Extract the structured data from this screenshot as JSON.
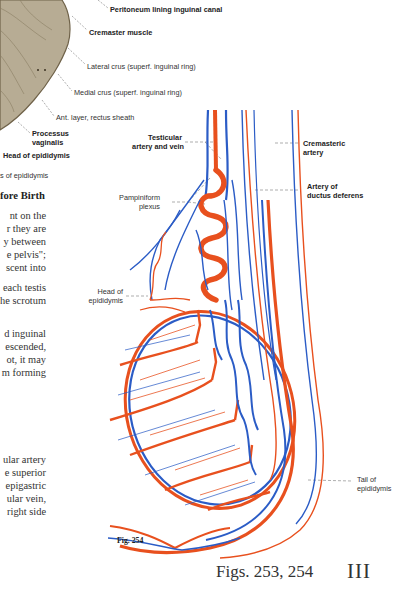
{
  "fig253_labels": {
    "peritoneum": "Peritoneum lining inguinal canal",
    "cremaster": "Cremaster muscle",
    "lateral_crus": "Lateral crus (superf. inguinal ring)",
    "medial_crus": "Medial crus (superf. inguinal ring)",
    "ant_layer": "Ant. layer, rectus sheath",
    "processus_1": "Processus",
    "processus_2": "vaginalis",
    "head_epididymis": "Head of epididymis",
    "body_epididymis": "s of epididymis"
  },
  "fig254_labels": {
    "testicular_1": "Testicular",
    "testicular_2": "artery and vein",
    "cremasteric_1": "Cremasteric",
    "cremasteric_2": "artery",
    "ductus_1": "Artery of",
    "ductus_2": "ductus deferens",
    "pampiniform_1": "Pampiniform",
    "pampiniform_2": "plexus",
    "head_1": "Head of",
    "head_2": "epididymis",
    "tail_1": "Tail of",
    "tail_2": "epididymis"
  },
  "text_block": {
    "heading": "fore Birth",
    "para1": [
      "nt on the",
      "r they are",
      "y between",
      "e pelvis\";",
      "scent into"
    ],
    "para2": [
      "each testis",
      "he scrotum"
    ],
    "para3": [
      "d inguinal",
      "escended,",
      "ot, it may",
      "m forming"
    ],
    "para4": [
      "ular artery",
      "e superior",
      "epigastric",
      "ular vein,",
      "right side"
    ]
  },
  "captions": {
    "fig254": "Fig. 254",
    "figs": "Figs. 253, 254",
    "chapter": "III"
  },
  "colors": {
    "artery": "#e8501e",
    "vein": "#2b5cc6",
    "muscle": "#b6ab93",
    "muscle_edge": "#7c6e55",
    "leader": "#666666"
  }
}
